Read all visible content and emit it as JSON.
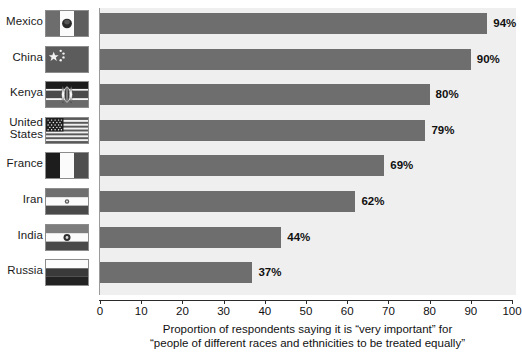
{
  "chart_data": {
    "type": "bar",
    "orientation": "horizontal",
    "title": "",
    "xlabel": "Proportion of respondents saying it is “very important” for “people of different races and ethnicities to be treated equally”",
    "ylabel": "",
    "xlim": [
      0,
      100
    ],
    "xticks": [
      0,
      10,
      20,
      30,
      40,
      50,
      60,
      70,
      80,
      90,
      100
    ],
    "xtick_labels": [
      "0",
      "10",
      "20",
      "30",
      "40",
      "50",
      "60",
      "70",
      "80",
      "90",
      "100"
    ],
    "grid": false,
    "legend": "none",
    "categories": [
      "Mexico",
      "China",
      "Kenya",
      "United States",
      "France",
      "Iran",
      "India",
      "Russia"
    ],
    "values": [
      94,
      90,
      80,
      79,
      69,
      62,
      44,
      37
    ],
    "value_labels": [
      "94%",
      "90%",
      "80%",
      "79%",
      "69%",
      "62%",
      "44%",
      "37%"
    ],
    "bar_color": "#6e6e6e",
    "plot_background": "#efefef"
  },
  "caption": {
    "line1": "Proportion of respondents saying it is “very important” for",
    "line2": "“people of different races and ethnicities to be treated equally”"
  },
  "rows": [
    {
      "country": "Mexico",
      "country_lines": [
        "Mexico"
      ],
      "value": 94,
      "value_label": "94%",
      "flag": "flag-mexico"
    },
    {
      "country": "China",
      "country_lines": [
        "China"
      ],
      "value": 90,
      "value_label": "90%",
      "flag": "flag-china"
    },
    {
      "country": "Kenya",
      "country_lines": [
        "Kenya"
      ],
      "value": 80,
      "value_label": "80%",
      "flag": "flag-kenya"
    },
    {
      "country": "United States",
      "country_lines": [
        "United",
        "States"
      ],
      "value": 79,
      "value_label": "79%",
      "flag": "flag-united-states"
    },
    {
      "country": "France",
      "country_lines": [
        "France"
      ],
      "value": 69,
      "value_label": "69%",
      "flag": "flag-france"
    },
    {
      "country": "Iran",
      "country_lines": [
        "Iran"
      ],
      "value": 62,
      "value_label": "62%",
      "flag": "flag-iran"
    },
    {
      "country": "India",
      "country_lines": [
        "India"
      ],
      "value": 44,
      "value_label": "44%",
      "flag": "flag-india"
    },
    {
      "country": "Russia",
      "country_lines": [
        "Russia"
      ],
      "value": 37,
      "value_label": "37%",
      "flag": "flag-russia"
    }
  ],
  "colors": {
    "bar": "#6e6e6e",
    "plot_bg": "#efefef",
    "axis": "#2b2b2b",
    "text": "#111111"
  }
}
